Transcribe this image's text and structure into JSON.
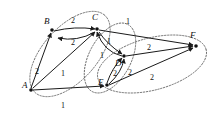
{
  "figure": {
    "background_color": "#ffffff",
    "ink_color": "#111111",
    "cluster_stroke_color": "#5a5a5a",
    "width": 222,
    "height": 113
  },
  "nodes": [
    {
      "id": "A",
      "label": "A",
      "x": 31,
      "y": 90,
      "label_x": 22,
      "label_y": 88
    },
    {
      "id": "B",
      "label": "B",
      "x": 52,
      "y": 30,
      "label_x": 44,
      "label_y": 24
    },
    {
      "id": "C",
      "label": "C",
      "x": 97,
      "y": 29,
      "label_x": 92,
      "label_y": 20
    },
    {
      "id": "D",
      "label": "D",
      "x": 124,
      "y": 56,
      "label_x": 115,
      "label_y": 66
    },
    {
      "id": "E",
      "label": "E",
      "x": 107,
      "y": 85,
      "label_x": 98,
      "label_y": 85
    },
    {
      "id": "F",
      "label": "F",
      "x": 196,
      "y": 46,
      "label_x": 190,
      "label_y": 38
    }
  ],
  "edges": [
    {
      "id": "B-C-top",
      "from": "B",
      "to": "C",
      "weight": "2",
      "label_x": 71,
      "label_y": 23
    },
    {
      "id": "C-B-bot",
      "from": "C",
      "to": "B",
      "weight": "2",
      "label_x": 71,
      "label_y": 45
    },
    {
      "id": "A-B",
      "from": "A",
      "to": "B",
      "weight": "2",
      "label_x": 35,
      "label_y": 74
    },
    {
      "id": "A-C",
      "from": "A",
      "to": "C",
      "weight": "1",
      "label_x": 61,
      "label_y": 76
    },
    {
      "id": "A-E",
      "from": "A",
      "to": "E",
      "weight": "1",
      "label_x": 61,
      "label_y": 108
    },
    {
      "id": "C-F",
      "from": "C",
      "to": "F",
      "weight": "1",
      "label_x": 126,
      "label_y": 24
    },
    {
      "id": "C-D",
      "from": "C",
      "to": "D",
      "weight": "1",
      "label_x": 107,
      "label_y": 44
    },
    {
      "id": "D-C",
      "from": "D",
      "to": "C",
      "weight": "1",
      "label_x": 100,
      "label_y": 58
    },
    {
      "id": "D-F",
      "from": "D",
      "to": "F",
      "weight": "2",
      "label_x": 147,
      "label_y": 50
    },
    {
      "id": "E-D-left",
      "from": "E",
      "to": "D",
      "weight": "2",
      "label_x": 113,
      "label_y": 76
    },
    {
      "id": "E-D-right",
      "from": "E",
      "to": "D",
      "weight": "2",
      "label_x": 128,
      "label_y": 75
    },
    {
      "id": "E-F",
      "from": "E",
      "to": "F",
      "weight": "2",
      "label_x": 150,
      "label_y": 80
    }
  ],
  "clusters": [
    {
      "id": "cluster-abc",
      "members": "A,B,C",
      "cx": 70,
      "cy": 54,
      "rx": 52,
      "ry": 27,
      "rotation": -48
    },
    {
      "id": "cluster-cde",
      "members": "C,D,E",
      "cx": 110,
      "cy": 58,
      "rx": 38,
      "ry": 21,
      "rotation": -62
    },
    {
      "id": "cluster-def",
      "members": "D,E,F",
      "cx": 152,
      "cy": 64,
      "rx": 56,
      "ry": 26,
      "rotation": -15
    }
  ]
}
